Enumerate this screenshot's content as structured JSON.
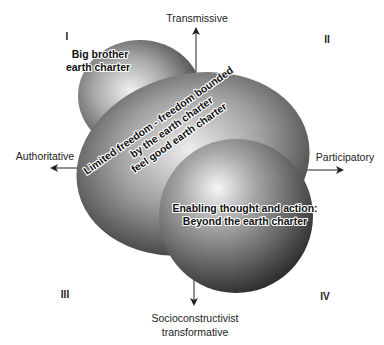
{
  "diagram": {
    "axes": {
      "top": "Transmissive",
      "left": "Authoritative",
      "right": "Participatory",
      "bottom_line1": "Socioconstructivist",
      "bottom_line2": "transformative"
    },
    "quadrants": {
      "q1": "I",
      "q2": "II",
      "q3": "III",
      "q4": "IV"
    },
    "shapes": {
      "big_brother": {
        "line1": "Big brother",
        "line2": "earth charter"
      },
      "limited_freedom": {
        "line1": "Limited freedom - freedom bounded",
        "line2": "by the earth charter",
        "line3": "feel good earth charter"
      },
      "enabling": {
        "line1": "Enabling thought and action:",
        "line2": "Beyond the earth charter"
      }
    },
    "colors": {
      "sphere_light": "#f2f2f2",
      "sphere_mid": "#9a9a9a",
      "sphere_dark": "#3a3a3a",
      "axis": "#222222"
    }
  }
}
